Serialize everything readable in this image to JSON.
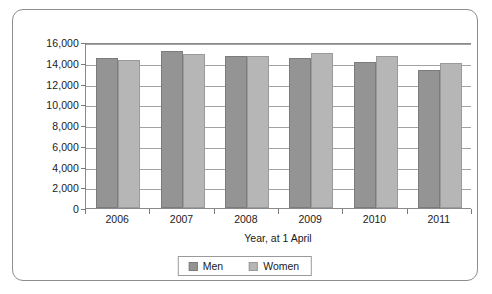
{
  "chart_data": {
    "type": "bar",
    "title": "",
    "subtitle": "",
    "xlabel": "Year, at 1 April",
    "ylabel": "",
    "categories": [
      "2006",
      "2007",
      "2008",
      "2009",
      "2010",
      "2011"
    ],
    "series": [
      {
        "name": "Men",
        "color": "#949494",
        "values": [
          14500,
          15100,
          14700,
          14500,
          14050,
          13300
        ]
      },
      {
        "name": "Women",
        "color": "#b6b6b6",
        "values": [
          14250,
          14800,
          14700,
          14900,
          14650,
          14000
        ]
      }
    ],
    "ylim": [
      0,
      16000
    ],
    "ytick_values": [
      0,
      2000,
      4000,
      6000,
      8000,
      10000,
      12000,
      14000,
      16000
    ],
    "ytick_labels": [
      "0",
      "2,000",
      "4,000",
      "6,000",
      "8,000",
      "10,000",
      "12,000",
      "14,000",
      "16,000"
    ],
    "grid": true,
    "grid_axis": "y",
    "legend_position": "bottom",
    "legend_entries": [
      "Men",
      "Women"
    ]
  },
  "frame": {
    "border_color": "#8d8d8d"
  }
}
